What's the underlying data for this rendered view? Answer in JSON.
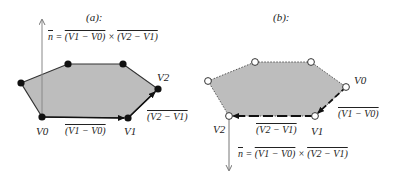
{
  "colors": {
    "fill": "#bdbdbd",
    "edge": "#333333",
    "arrow": "#111111",
    "axis": "#888888",
    "vertex_filled": "#111111",
    "vertex_open_fill": "#ffffff"
  },
  "panel_a": {
    "title": "(a):",
    "normal_equation": {
      "n": "n",
      "eq": " = ",
      "term1": "(V1 − V0)",
      "times": " × ",
      "term2": "(V2 − V1)"
    },
    "vertex_labels": {
      "v0": "V0",
      "v1": "V1",
      "v2": "V2"
    },
    "edge_labels": {
      "v1_minus_v0": "(V1 − V0)",
      "v2_minus_v1": "(V2 − V1)"
    },
    "vertex_style": "filled",
    "normal_direction": "up"
  },
  "panel_b": {
    "title": "(b):",
    "normal_equation": {
      "n": "n",
      "eq": " = ",
      "term1": "(V1 − V0)",
      "times": " × ",
      "term2": "(V2 − V1)"
    },
    "vertex_labels": {
      "v0": "V0",
      "v1": "V1",
      "v2": "V2"
    },
    "edge_labels": {
      "v1_minus_v0": "(V1 − V0)",
      "v2_minus_v1": "(V2 − V1)"
    },
    "vertex_style": "open",
    "normal_direction": "down"
  }
}
